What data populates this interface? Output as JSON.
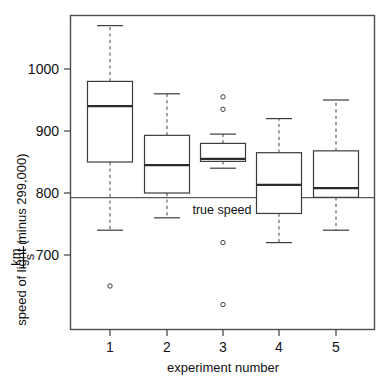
{
  "chart_data": {
    "type": "box",
    "title": "",
    "xlabel": "experiment number",
    "ylabel_prefix": "speed of light (",
    "ylabel_numerator": "km",
    "ylabel_denominator": "s",
    "ylabel_suffix": " minus 299,000)",
    "ylabel_full": "speed of light ( km / s minus 299,000)",
    "categories": [
      "1",
      "2",
      "3",
      "4",
      "5"
    ],
    "xtick_labels": [
      "1",
      "2",
      "3",
      "4",
      "5"
    ],
    "ytick_labels": [
      "700",
      "800",
      "900",
      "1000"
    ],
    "ytick_values": [
      700,
      800,
      900,
      1000
    ],
    "ylim": [
      615,
      1085
    ],
    "xlim": [
      0.5,
      5.5
    ],
    "grid": false,
    "legend": false,
    "reference_line": {
      "label": "true speed",
      "value": 792.458,
      "label_x_position": 3.0
    },
    "boxes": [
      {
        "category": "1",
        "whisker_low": 740,
        "q1": 850,
        "median": 940,
        "q3": 980,
        "whisker_high": 1070,
        "outliers": [
          650
        ]
      },
      {
        "category": "2",
        "whisker_low": 760,
        "q1": 800,
        "median": 845,
        "q3": 893,
        "whisker_high": 960,
        "outliers": []
      },
      {
        "category": "3",
        "whisker_low": 840,
        "q1": 851,
        "median": 855,
        "q3": 880,
        "whisker_high": 895,
        "outliers": [
          955,
          935,
          720,
          620
        ]
      },
      {
        "category": "4",
        "whisker_low": 720,
        "q1": 767,
        "median": 813,
        "q3": 865,
        "whisker_high": 920,
        "outliers": []
      },
      {
        "category": "5",
        "whisker_low": 740,
        "q1": 793,
        "median": 808,
        "q3": 868,
        "whisker_high": 950,
        "outliers": []
      }
    ],
    "colors": {
      "box_fill": "#ffffff",
      "box_stroke": "#3c3c3c",
      "median": "#2b2b2b",
      "whisker": "#555555",
      "reference_line": "#595959",
      "frame": "#4d4d4d",
      "background": "#ffffff"
    }
  }
}
